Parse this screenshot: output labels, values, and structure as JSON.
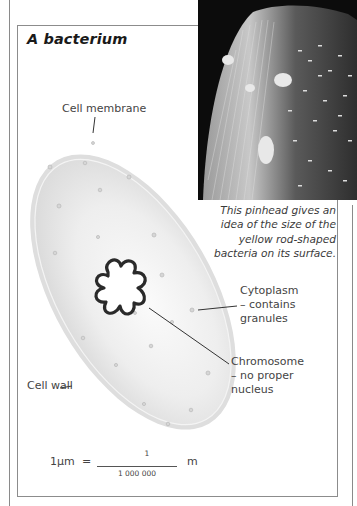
{
  "page": {
    "title": "A bacterium"
  },
  "photo": {
    "description": "Electron micrograph of a pinhead covered with rod-shaped bacteria",
    "caption": [
      "This pinhead gives an",
      "idea of the size of the",
      "yellow rod-shaped",
      "bacteria on its surface."
    ]
  },
  "diagram": {
    "labels": {
      "cell_membrane": "Cell membrane",
      "cytoplasm": [
        "Cytoplasm",
        "– contains",
        "granules"
      ],
      "chromosome": [
        "Chromosome",
        "– no proper",
        "nucleus"
      ],
      "cell_wall": "Cell wall"
    }
  },
  "equation": {
    "lhs": "1µm",
    "equals": "=",
    "numerator": "1",
    "denominator": "1 000 000",
    "unit": "m"
  },
  "colors": {
    "cell_fill": "#e6e6e6",
    "cell_wall": "#d2d2d2",
    "chromosome_stroke": "#2a2a2a",
    "photo_bg": "#0c0c0c",
    "frame": "#8c8c8c"
  }
}
